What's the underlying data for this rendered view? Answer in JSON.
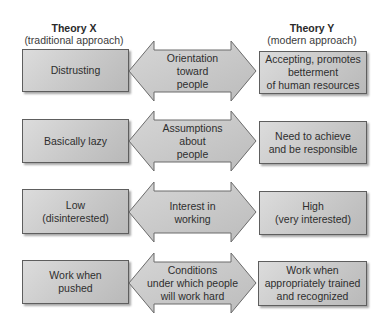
{
  "headers": {
    "left": {
      "title": "Theory X",
      "subtitle": "(traditional approach)"
    },
    "right": {
      "title": "Theory Y",
      "subtitle": "(modern approach)"
    }
  },
  "rows": [
    {
      "theory_x": "Distrusting",
      "dimension": "Orientation\ntoward\npeople",
      "theory_y": "Accepting, promotes\nbetterment\nof human resources"
    },
    {
      "theory_x": "Basically lazy",
      "dimension": "Assumptions\nabout\npeople",
      "theory_y": "Need to achieve\nand be responsible"
    },
    {
      "theory_x": "Low\n(disinterested)",
      "dimension": "Interest in\nworking",
      "theory_y": "High\n(very interested)"
    },
    {
      "theory_x": "Work when\npushed",
      "dimension": "Conditions\nunder which people\nwill work hard",
      "theory_y": "Work when\nappropriately trained\nand recognized"
    }
  ],
  "colors": {
    "box_fill": "#c6c6c6",
    "arrow_fill": "#c8c8c8",
    "stroke": "#5e5e5e"
  }
}
